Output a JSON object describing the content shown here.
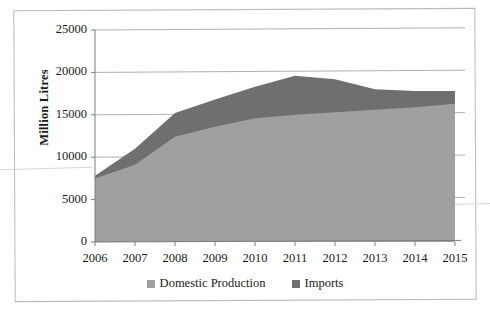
{
  "figure": {
    "frame_color": "#b9b9b9",
    "background": "#ffffff"
  },
  "chart_data": {
    "type": "area",
    "stacked": true,
    "title": "",
    "xlabel": "",
    "ylabel": "Million Litres",
    "categories": [
      "2006",
      "2007",
      "2008",
      "2009",
      "2010",
      "2011",
      "2012",
      "2013",
      "2014",
      "2015"
    ],
    "x": [
      2006,
      2007,
      2008,
      2009,
      2010,
      2011,
      2012,
      2013,
      2014,
      2015
    ],
    "series": [
      {
        "name": "Domestic Production",
        "color": "#a0a0a0",
        "values": [
          7500,
          9100,
          12400,
          13600,
          14600,
          15000,
          15300,
          15600,
          15900,
          16300
        ]
      },
      {
        "name": "Imports",
        "color": "#6f6f6f",
        "values": [
          300,
          1900,
          2800,
          3200,
          3700,
          4600,
          3900,
          2400,
          1900,
          1500
        ]
      }
    ],
    "totals": [
      7800,
      11000,
      15200,
      16800,
      18300,
      19600,
      19200,
      18000,
      17800,
      17800
    ],
    "ylim": [
      0,
      25000
    ],
    "yticks": [
      0,
      5000,
      10000,
      15000,
      20000,
      25000
    ],
    "ytick_labels": [
      "0",
      "5000",
      "10000",
      "15000",
      "20000",
      "25000"
    ],
    "xlim": [
      2006,
      2015
    ],
    "grid": "horizontal",
    "legend_position": "bottom"
  },
  "legend": {
    "items": [
      {
        "label": "Domestic Production",
        "color": "#a0a0a0"
      },
      {
        "label": "Imports",
        "color": "#6f6f6f"
      }
    ]
  }
}
